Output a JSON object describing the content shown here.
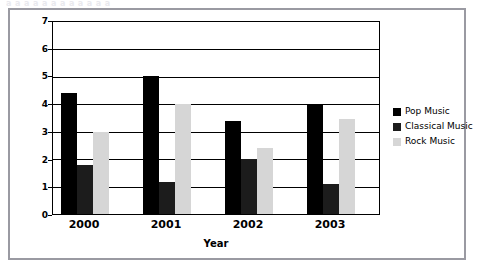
{
  "page": {
    "clipped_header_text": "a a a a a a a a a a a a"
  },
  "chart_data": {
    "type": "bar",
    "title": "",
    "subtitle": "",
    "xlabel": "Year",
    "ylabel": "£'s in billions",
    "categories": [
      "2000",
      "2001",
      "2002",
      "2003"
    ],
    "series": [
      {
        "name": "Pop Music",
        "color": "#000000",
        "values": [
          4.4,
          5.05,
          3.4,
          4.0
        ]
      },
      {
        "name": "Classical Music",
        "color": "#1c1c1c",
        "values": [
          1.8,
          1.15,
          2.0,
          1.1
        ]
      },
      {
        "name": "Rock Music",
        "color": "#d6d6d6",
        "values": [
          3.0,
          4.0,
          2.4,
          3.45
        ]
      }
    ],
    "ylim": [
      0,
      7
    ],
    "yticks": [
      0,
      1,
      2,
      3,
      4,
      5,
      6,
      7
    ],
    "ytick_labels": [
      "0",
      "1",
      "2",
      "3",
      "4",
      "5",
      "6",
      "7"
    ],
    "grid": true,
    "grid_axis": "y",
    "legend_position": "right",
    "legend_entries": [
      "Pop Music",
      "Classical Music",
      "Rock Music"
    ]
  }
}
